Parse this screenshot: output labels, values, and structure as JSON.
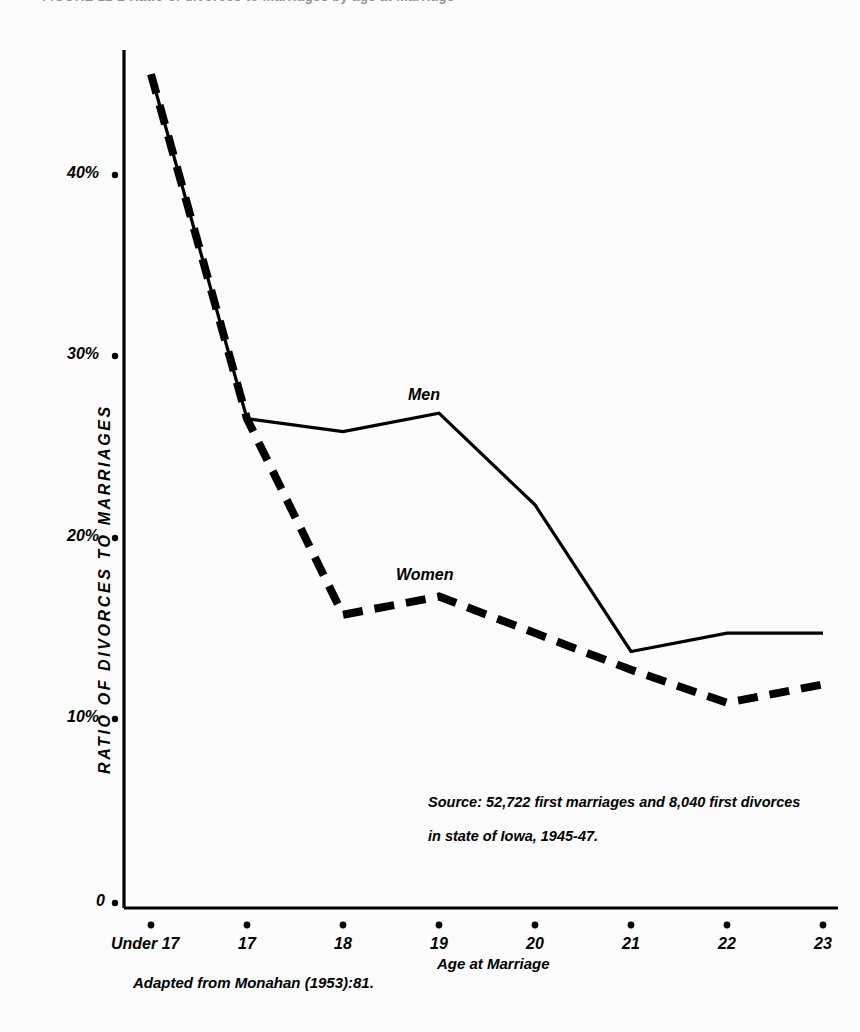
{
  "figure": {
    "title": "FIGURE 12-2   Ratio of divorces to marriages by age at marriage",
    "axis_titles": {
      "x": "Age at Marriage",
      "y": "RATIO OF DIVORCES TO MARRIAGES"
    },
    "source_note_line1": "Source: 52,722 first marriages and 8,040 first divorces",
    "source_note_line2": "in state of Iowa, 1945-47.",
    "caption": "Adapted from Monahan (1953):81.",
    "series_labels": {
      "men": "Men",
      "women": "Women"
    }
  },
  "chart_data": {
    "type": "line",
    "title": "Ratio of divorces to marriages by age at marriage",
    "xlabel": "Age at Marriage",
    "ylabel": "RATIO OF DIVORCES TO MARRIAGES",
    "categories": [
      "Under 17",
      "17",
      "18",
      "19",
      "20",
      "21",
      "22",
      "23"
    ],
    "x_tick_labels": [
      "Under 17",
      "17",
      "18",
      "19",
      "20",
      "21",
      "22",
      "23"
    ],
    "y_tick_labels": [
      "0",
      "10%",
      "20%",
      "30%",
      "40%"
    ],
    "y_tick_values": [
      0,
      10,
      20,
      30,
      40
    ],
    "ylim": [
      0,
      47
    ],
    "grid": false,
    "legend": "inline-annotations",
    "series": [
      {
        "name": "Men",
        "style": "solid",
        "color": "#000000",
        "values": [
          45.5,
          26.7,
          26.0,
          27.0,
          22.0,
          14.0,
          15.0,
          15.0
        ]
      },
      {
        "name": "Women",
        "style": "dashed",
        "color": "#000000",
        "values": [
          45.5,
          26.7,
          16.0,
          17.0,
          15.0,
          13.0,
          11.2,
          12.2
        ]
      }
    ],
    "annotations": [
      {
        "text": "Men",
        "x": "19",
        "y": 29.5
      },
      {
        "text": "Women",
        "x": "19",
        "y": 19.5
      },
      {
        "text": "Source: 52,722 first marriages and 8,040 first divorces",
        "x": "21",
        "y": 7.5
      },
      {
        "text": "in state of Iowa, 1945-47.",
        "x": "21",
        "y": 5.5
      }
    ]
  }
}
